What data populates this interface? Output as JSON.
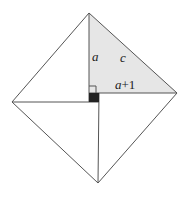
{
  "diagram": {
    "type": "geometric-proof",
    "labels": {
      "leg_short": "a",
      "hypotenuse": "c",
      "leg_long_var": "a",
      "leg_long_plus": "+1"
    },
    "colors": {
      "stroke": "#555555",
      "shade": "#e6e6e6",
      "center_square": "#222222"
    },
    "vertices": {
      "top": [
        89,
        13
      ],
      "right": [
        177,
        93
      ],
      "bottom": [
        98,
        183
      ],
      "left": [
        12,
        102
      ],
      "center_square": {
        "x": 89,
        "y": 93,
        "size": 10
      }
    }
  }
}
